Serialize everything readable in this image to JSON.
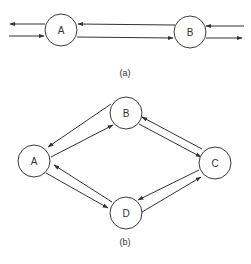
{
  "figure_a": {
    "caption": "(a)",
    "nodes": [
      {
        "id": "A",
        "label": "A",
        "cx": 61,
        "cy": 30,
        "r": 16
      },
      {
        "id": "B",
        "label": "B",
        "cx": 190,
        "cy": 32,
        "r": 16
      }
    ],
    "edges": [
      {
        "from": "A",
        "to": "external-left",
        "direction": "outgoing"
      },
      {
        "from": "external-left",
        "to": "A",
        "direction": "incoming"
      },
      {
        "from": "B",
        "to": "A"
      },
      {
        "from": "A",
        "to": "B"
      },
      {
        "from": "external-right",
        "to": "B",
        "direction": "incoming"
      },
      {
        "from": "B",
        "to": "external-right",
        "direction": "outgoing"
      }
    ]
  },
  "figure_b": {
    "caption": "(b)",
    "nodes": [
      {
        "id": "A",
        "label": "A",
        "cx": 34,
        "cy": 161,
        "r": 16
      },
      {
        "id": "B",
        "label": "B",
        "cx": 126,
        "cy": 113,
        "r": 16
      },
      {
        "id": "C",
        "label": "C",
        "cx": 215,
        "cy": 163,
        "r": 16
      },
      {
        "id": "D",
        "label": "D",
        "cx": 126,
        "cy": 213,
        "r": 16
      }
    ],
    "edges": [
      {
        "from": "A",
        "to": "B"
      },
      {
        "from": "B",
        "to": "A"
      },
      {
        "from": "B",
        "to": "C"
      },
      {
        "from": "C",
        "to": "B"
      },
      {
        "from": "C",
        "to": "D"
      },
      {
        "from": "D",
        "to": "C"
      },
      {
        "from": "D",
        "to": "A"
      },
      {
        "from": "A",
        "to": "D"
      }
    ]
  }
}
